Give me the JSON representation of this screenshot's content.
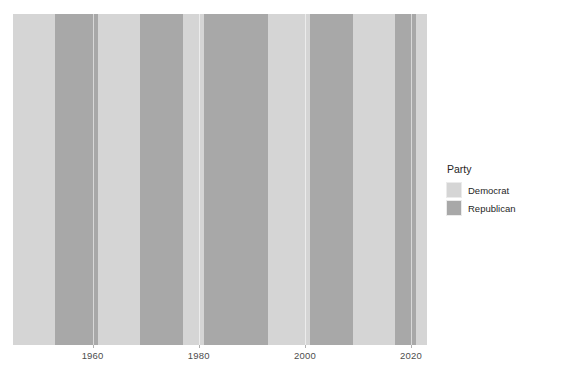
{
  "chart_data": {
    "type": "bar",
    "title": "",
    "subtitle": "",
    "xlabel": "",
    "ylabel": "",
    "xlim": [
      1945,
      2023
    ],
    "grid": true,
    "legend_position": "right",
    "legend_title": "Party",
    "colors": {
      "panel_background": "#ebebeb",
      "Democrat": "#d5d5d5",
      "Republican": "#a8a8a8",
      "gridline": "#ffffff",
      "axis_text": "#4d4d4d",
      "legend_text": "#262626"
    },
    "categories": [
      "Democrat",
      "Republican"
    ],
    "x_ticks": [
      {
        "value": 1960,
        "label": "1960"
      },
      {
        "value": 1980,
        "label": "1980"
      },
      {
        "value": 2000,
        "label": "2000"
      },
      {
        "value": 2020,
        "label": "2020"
      }
    ],
    "series": [
      {
        "name": "Party",
        "bands": [
          {
            "start": 1945,
            "end": 1953,
            "party": "Democrat"
          },
          {
            "start": 1953,
            "end": 1961,
            "party": "Republican"
          },
          {
            "start": 1961,
            "end": 1969,
            "party": "Democrat"
          },
          {
            "start": 1969,
            "end": 1977,
            "party": "Republican"
          },
          {
            "start": 1977,
            "end": 1981,
            "party": "Democrat"
          },
          {
            "start": 1981,
            "end": 1993,
            "party": "Republican"
          },
          {
            "start": 1993,
            "end": 2001,
            "party": "Democrat"
          },
          {
            "start": 2001,
            "end": 2009,
            "party": "Republican"
          },
          {
            "start": 2009,
            "end": 2017,
            "party": "Democrat"
          },
          {
            "start": 2017,
            "end": 2021,
            "party": "Republican"
          },
          {
            "start": 2021,
            "end": 2023,
            "party": "Democrat"
          }
        ]
      }
    ]
  },
  "legend": {
    "title": "Party",
    "items": [
      {
        "label": "Democrat",
        "color": "#d5d5d5"
      },
      {
        "label": "Republican",
        "color": "#a8a8a8"
      }
    ]
  },
  "axis": {
    "x_tick_labels": [
      "1960",
      "1980",
      "2000",
      "2020"
    ]
  }
}
